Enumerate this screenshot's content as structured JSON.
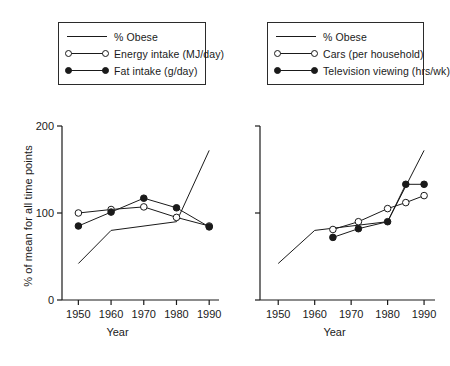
{
  "chart_data": [
    {
      "panel": "left",
      "type": "line",
      "title": "",
      "xlabel": "Year",
      "ylabel": "% of mean for all time points",
      "xlim": [
        1945,
        1993
      ],
      "ylim": [
        0,
        200
      ],
      "xticks": [
        1950,
        1960,
        1970,
        1980,
        1990
      ],
      "yticks": [
        0,
        100,
        200
      ],
      "grid": false,
      "legend_position": "above-plot",
      "series": [
        {
          "name": "% Obese",
          "marker": "none",
          "x": [
            1950,
            1960,
            1980,
            1990
          ],
          "values": [
            42,
            80,
            90,
            172
          ]
        },
        {
          "name": "Energy intake (MJ/day)",
          "marker": "open-circle",
          "x": [
            1950,
            1960,
            1970,
            1980,
            1990
          ],
          "values": [
            100,
            104,
            107,
            95,
            85
          ]
        },
        {
          "name": "Fat intake (g/day)",
          "marker": "filled-circle",
          "x": [
            1950,
            1960,
            1970,
            1980,
            1990
          ],
          "values": [
            85,
            101,
            117,
            106,
            84
          ]
        }
      ]
    },
    {
      "panel": "right",
      "type": "line",
      "title": "",
      "xlabel": "Year",
      "ylabel": "",
      "xlim": [
        1945,
        1993
      ],
      "ylim": [
        0,
        200
      ],
      "xticks": [
        1950,
        1960,
        1970,
        1980,
        1990
      ],
      "yticks": [
        0,
        100,
        200
      ],
      "grid": false,
      "legend_position": "above-plot",
      "series": [
        {
          "name": "% Obese",
          "marker": "none",
          "x": [
            1950,
            1960,
            1980,
            1990
          ],
          "values": [
            42,
            80,
            90,
            172
          ]
        },
        {
          "name": "Cars (per household)",
          "marker": "open-circle",
          "x": [
            1965,
            1972,
            1980,
            1985,
            1990
          ],
          "values": [
            81,
            90,
            105,
            112,
            120
          ]
        },
        {
          "name": "Television viewing (hrs/wk)",
          "marker": "filled-circle",
          "x": [
            1965,
            1972,
            1980,
            1985,
            1990
          ],
          "values": [
            72,
            82,
            90,
            133,
            133
          ]
        }
      ]
    }
  ],
  "legend_left": {
    "items": [
      {
        "label": "% Obese",
        "marker": "none"
      },
      {
        "label": "Energy intake (MJ/day)",
        "marker": "open-circle"
      },
      {
        "label": "Fat intake (g/day)",
        "marker": "filled-circle"
      }
    ]
  },
  "legend_right": {
    "items": [
      {
        "label": "% Obese",
        "marker": "none"
      },
      {
        "label": "Cars (per household)",
        "marker": "open-circle"
      },
      {
        "label": "Television viewing (hrs/wk)",
        "marker": "filled-circle"
      }
    ]
  },
  "axes": {
    "ylabel": "% of mean for all time points",
    "xlabel": "Year",
    "yticks": [
      "200",
      "100",
      "0"
    ],
    "xticks": [
      "1950",
      "1960",
      "1970",
      "1980",
      "1990"
    ]
  },
  "colors": {
    "ink": "#1a1a1a",
    "background": "#ffffff"
  }
}
